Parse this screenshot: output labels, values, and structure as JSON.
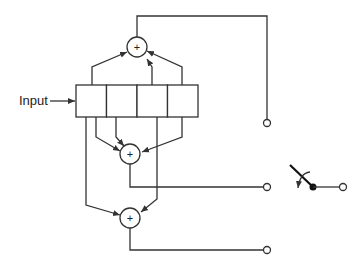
{
  "diagram": {
    "type": "convolutional-encoder",
    "input_label": "Input",
    "shift_register": {
      "stages": 4
    },
    "adders": [
      {
        "id": "adder-1",
        "symbol": "+",
        "taps": [
          1,
          3,
          4
        ]
      },
      {
        "id": "adder-2",
        "symbol": "+",
        "taps": [
          1,
          2,
          3,
          4
        ]
      },
      {
        "id": "adder-3",
        "symbol": "+",
        "taps": [
          1,
          3
        ]
      }
    ],
    "outputs": [
      "output-1",
      "output-2",
      "output-3"
    ],
    "commutator_switch": {
      "position": "output-2"
    },
    "colors": {
      "line": "#333333",
      "background": "#ffffff"
    }
  }
}
